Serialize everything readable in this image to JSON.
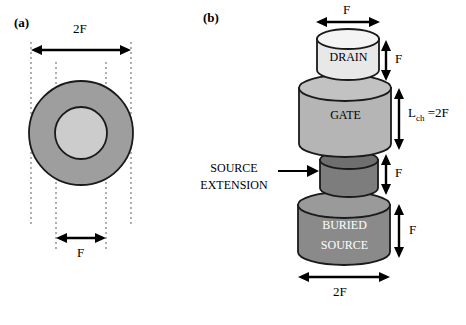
{
  "figure": {
    "panels": [
      {
        "id": "a",
        "label": "(a)"
      },
      {
        "id": "b",
        "label": "(b)"
      }
    ]
  },
  "panel_a": {
    "label": "(a)",
    "top_dimension": "2F",
    "bottom_dimension": "F",
    "outer_ring_name": "outer-annulus",
    "inner_disc_name": "inner-disc",
    "colors": {
      "outer_ring_fill": "#9e9e9e",
      "inner_disc_fill": "#cccccc",
      "outline": "#1a1a1a",
      "guide_line": "#999999"
    }
  },
  "panel_b": {
    "label": "(b)",
    "top_dimension": "F",
    "bottom_dimension": "2F",
    "callout": {
      "line1": "SOURCE",
      "line2": "EXTENSION"
    },
    "stack": [
      {
        "name": "drain",
        "label": "DRAIN",
        "fill": "#e8e8e8",
        "text_color": "#000000",
        "height_dimension": "F"
      },
      {
        "name": "gate",
        "label": "GATE",
        "fill": "#b5b5b5",
        "text_color": "#000000",
        "height_dimension": "L_ch =2F",
        "height_dimension_base": "L",
        "height_dimension_sub": "ch",
        "height_dimension_rest": " =2F"
      },
      {
        "name": "source-extension",
        "label": "",
        "fill": "#7d7d7d",
        "text_color": "#000000",
        "height_dimension": "F"
      },
      {
        "name": "buried-source",
        "label_line1": "BURIED",
        "label_line2": "SOURCE",
        "fill": "#8a8a8a",
        "text_color": "#ffffff",
        "height_dimension": "F"
      }
    ]
  }
}
